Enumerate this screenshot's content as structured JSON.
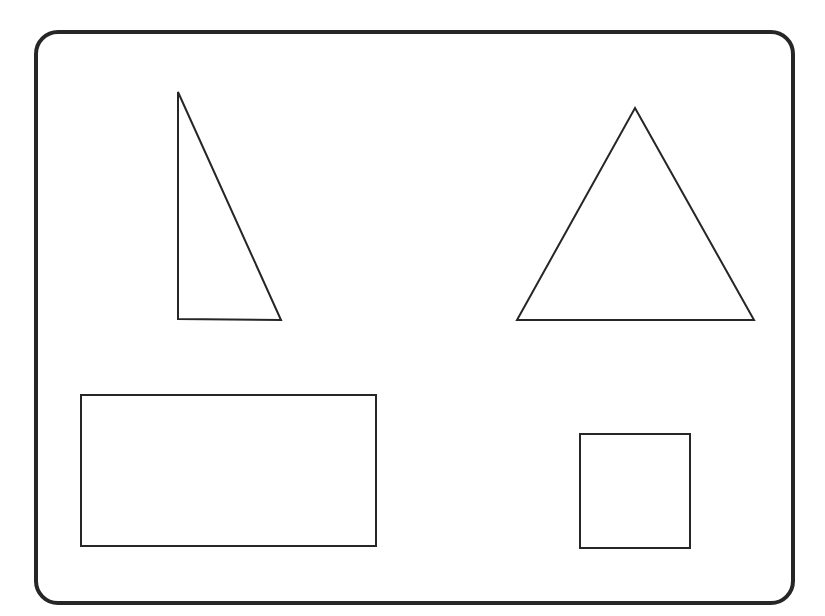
{
  "canvas": {
    "name": "geometric-shapes-worksheet",
    "width": 825,
    "height": 616,
    "background_color": "#ffffff",
    "stroke_color": "#262626",
    "fill_color": "none"
  },
  "frame": {
    "label": "rounded-rectangle-frame",
    "x": 36,
    "y": 32,
    "width": 757,
    "height": 571,
    "corner_radius": 22,
    "stroke_width": 4,
    "stroke_color": "#262626",
    "fill": "none"
  },
  "shapes": [
    {
      "id": "shape-1",
      "label": "right-triangle",
      "type": "polygon",
      "points": "178,92 178,319 281,320",
      "vertices": [
        [
          178,
          92
        ],
        [
          178,
          319
        ],
        [
          281,
          320
        ]
      ],
      "stroke_width": 2,
      "stroke_color": "#262626",
      "fill": "none",
      "position": "top-left",
      "bbox": {
        "x": 178,
        "y": 92,
        "width": 103,
        "height": 228
      }
    },
    {
      "id": "shape-2",
      "label": "isosceles-triangle",
      "type": "polygon",
      "points": "635,108 754,320 517,320",
      "vertices": [
        [
          635,
          108
        ],
        [
          754,
          320
        ],
        [
          517,
          320
        ]
      ],
      "stroke_width": 2,
      "stroke_color": "#262626",
      "fill": "none",
      "position": "top-right",
      "bbox": {
        "x": 517,
        "y": 108,
        "width": 237,
        "height": 212
      }
    },
    {
      "id": "shape-3",
      "label": "large-rectangle",
      "type": "rect",
      "x": 81,
      "y": 395,
      "width": 295,
      "height": 151,
      "stroke_width": 2,
      "stroke_color": "#262626",
      "fill": "none",
      "position": "bottom-left"
    },
    {
      "id": "shape-4",
      "label": "small-square",
      "type": "rect",
      "x": 580,
      "y": 434,
      "width": 110,
      "height": 114,
      "stroke_width": 2,
      "stroke_color": "#262626",
      "fill": "none",
      "position": "bottom-right"
    }
  ]
}
